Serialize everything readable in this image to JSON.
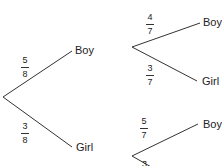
{
  "tree": {
    "first": {
      "upper": {
        "label": "Boy",
        "num": "5",
        "den": "8"
      },
      "lower": {
        "label": "Girl",
        "num": "3",
        "den": "8"
      }
    },
    "second_after_boy": {
      "upper": {
        "label": "Boy",
        "num": "4",
        "den": "7"
      },
      "lower": {
        "label": "Girl",
        "num": "3",
        "den": "7"
      }
    },
    "second_after_girl": {
      "upper": {
        "label": "Boy",
        "num": "5",
        "den": "7"
      },
      "lower": {
        "num": "3"
      }
    }
  },
  "colors": {
    "line": "#333333",
    "text": "#222222"
  }
}
